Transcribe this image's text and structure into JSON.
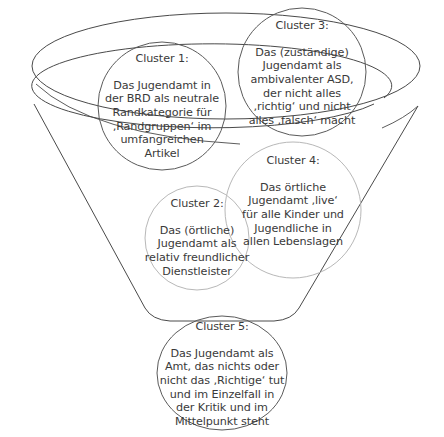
{
  "diagram": {
    "type": "funnel",
    "colors": {
      "outline_dark": "#4a4a4a",
      "outline_light": "#b8b8b8",
      "text": "#3a3a3a",
      "background": "#ffffff"
    },
    "clusters": [
      {
        "id": "cluster-1",
        "title": "Cluster 1:",
        "text": "Das Jugendamt in\nder BRD als neutrale\nRandkategorie für\n‚Randgruppen‘ im\numfangreichen\nArtikel"
      },
      {
        "id": "cluster-2",
        "title": "Cluster 2:",
        "text": "Das (örtliche)\nJugendamt als\nrelativ freundlicher\nDienstleister"
      },
      {
        "id": "cluster-3",
        "title": "Cluster 3:",
        "text": "Das (zuständige)\nJugendamt als\nambivalenter ASD,\nder nicht alles\n‚richtig‘ und nicht\nalles ‚falsch‘ macht"
      },
      {
        "id": "cluster-4",
        "title": "Cluster 4:",
        "text": "Das örtliche\nJugendamt ‚live‘\nfür alle Kinder und\nJugendliche in\nallen Lebenslagen"
      },
      {
        "id": "cluster-5",
        "title": "Cluster 5:",
        "text": "Das Jugendamt als\nAmt, das nichts oder\nnicht das ‚Richtige‘ tut\nund im Einzelfall in\nder Kritik und im\nMittelpunkt steht"
      }
    ]
  }
}
